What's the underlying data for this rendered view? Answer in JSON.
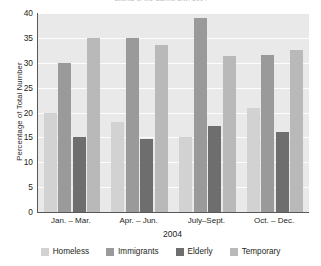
{
  "chart_data": {
    "type": "bar",
    "title": "Clients of the Caring City: 2004",
    "xlabel": "2004",
    "ylabel": "Percentage of Total Number",
    "categories": [
      "Jan. – Mar.",
      "Apr. – Jun.",
      "July–Sept.",
      "Oct. – Dec."
    ],
    "series": [
      {
        "name": "Homeless",
        "color": "#d2d2d2",
        "values": [
          20,
          18,
          15,
          21
        ]
      },
      {
        "name": "Immigrants",
        "color": "#9a9a9a",
        "values": [
          30,
          35,
          39,
          31.5
        ]
      },
      {
        "name": "Elderly",
        "color": "#6e6e6e",
        "values": [
          15,
          14.7,
          17.3,
          16
        ]
      },
      {
        "name": "Temporary",
        "color": "#b9b9b9",
        "values": [
          35,
          33.5,
          31.3,
          32.5
        ]
      }
    ],
    "ylim": [
      0,
      40
    ],
    "yticks": [
      40,
      35,
      30,
      25,
      20,
      15,
      10,
      5,
      0
    ],
    "grid": true,
    "legend_position": "bottom",
    "plot_background": "#e9e9e9",
    "axis_color": "#58585a"
  }
}
